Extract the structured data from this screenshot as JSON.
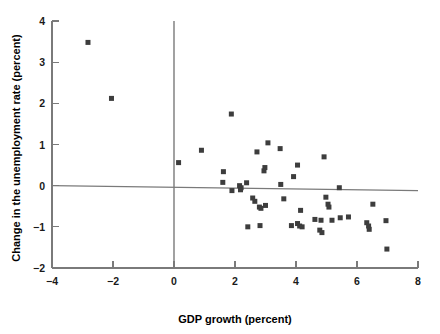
{
  "chart_data": {
    "type": "scatter",
    "title": "",
    "xlabel": "GDP growth (percent)",
    "ylabel": "Change in the unemployment rate (percent)",
    "xlim": [
      -4,
      8
    ],
    "ylim": [
      -2,
      4
    ],
    "xticks": [
      -4,
      -2,
      0,
      2,
      4,
      6,
      8
    ],
    "yticks": [
      -2,
      -1,
      0,
      1,
      2,
      3,
      4
    ],
    "xtick_labels": [
      "-4",
      "-2",
      "0",
      "2",
      "4",
      "6",
      "8"
    ],
    "ytick_labels": [
      "-2",
      "-1",
      "0",
      "1",
      "2",
      "3",
      "4"
    ],
    "grid": false,
    "legend": null,
    "marker": "square",
    "marker_color": "#3d3d3d",
    "marker_size": 5,
    "trendline": {
      "present": true,
      "x_start": -4,
      "y_start": 0.0,
      "x_end": 8,
      "y_end": -0.12,
      "color": "#7a7a7a"
    },
    "vertical_reference_line": {
      "present": true,
      "x": 0,
      "y_start": -2,
      "y_end": 4,
      "color": "#7a7a7a"
    },
    "points": [
      {
        "x": -2.82,
        "y": 3.48
      },
      {
        "x": -2.05,
        "y": 2.12
      },
      {
        "x": 0.15,
        "y": 0.56
      },
      {
        "x": 0.9,
        "y": 0.86
      },
      {
        "x": 1.62,
        "y": 0.34
      },
      {
        "x": 1.6,
        "y": 0.08
      },
      {
        "x": 1.88,
        "y": 1.74
      },
      {
        "x": 1.9,
        "y": -0.12
      },
      {
        "x": 2.15,
        "y": 0.0
      },
      {
        "x": 2.2,
        "y": -0.05
      },
      {
        "x": 2.18,
        "y": -0.1
      },
      {
        "x": 2.38,
        "y": 0.07
      },
      {
        "x": 2.42,
        "y": -1.0
      },
      {
        "x": 2.58,
        "y": -0.3
      },
      {
        "x": 2.65,
        "y": -0.38
      },
      {
        "x": 2.72,
        "y": 0.82
      },
      {
        "x": 2.8,
        "y": -0.52
      },
      {
        "x": 2.85,
        "y": -0.55
      },
      {
        "x": 2.82,
        "y": -0.97
      },
      {
        "x": 2.95,
        "y": 0.36
      },
      {
        "x": 2.98,
        "y": 0.44
      },
      {
        "x": 3.0,
        "y": -0.48
      },
      {
        "x": 3.08,
        "y": 1.04
      },
      {
        "x": 3.48,
        "y": 0.9
      },
      {
        "x": 3.5,
        "y": 0.03
      },
      {
        "x": 3.6,
        "y": -0.32
      },
      {
        "x": 3.85,
        "y": -0.97
      },
      {
        "x": 3.92,
        "y": 0.22
      },
      {
        "x": 4.05,
        "y": 0.5
      },
      {
        "x": 4.05,
        "y": -0.92
      },
      {
        "x": 4.12,
        "y": -0.98
      },
      {
        "x": 4.15,
        "y": -0.6
      },
      {
        "x": 4.2,
        "y": -1.0
      },
      {
        "x": 4.62,
        "y": -0.82
      },
      {
        "x": 4.78,
        "y": -1.08
      },
      {
        "x": 4.82,
        "y": -0.84
      },
      {
        "x": 4.85,
        "y": -1.14
      },
      {
        "x": 4.92,
        "y": 0.7
      },
      {
        "x": 4.98,
        "y": -0.28
      },
      {
        "x": 5.05,
        "y": -0.45
      },
      {
        "x": 5.08,
        "y": -0.52
      },
      {
        "x": 5.18,
        "y": -0.84
      },
      {
        "x": 5.42,
        "y": -0.05
      },
      {
        "x": 5.45,
        "y": -0.78
      },
      {
        "x": 5.72,
        "y": -0.76
      },
      {
        "x": 6.32,
        "y": -0.9
      },
      {
        "x": 6.38,
        "y": -0.98
      },
      {
        "x": 6.4,
        "y": -1.06
      },
      {
        "x": 6.52,
        "y": -0.45
      },
      {
        "x": 6.95,
        "y": -0.85
      },
      {
        "x": 6.98,
        "y": -1.54
      }
    ]
  }
}
